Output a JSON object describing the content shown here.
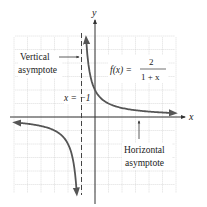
{
  "chart_data": {
    "type": "line",
    "title": "",
    "function_label": "f(x) = 2 / (1 + x)",
    "function_parts": {
      "lhs": "f(x) =",
      "numerator": "2",
      "denominator": "1 + x"
    },
    "xlabel": "x",
    "ylabel": "y",
    "xlim": [
      -6,
      6
    ],
    "ylim": [
      -6,
      6
    ],
    "grid": true,
    "series": [
      {
        "name": "f(x) = 2/(1+x), right branch",
        "x": [
          -0.82,
          -0.75,
          -0.5,
          -0.25,
          0,
          0.5,
          1,
          2,
          3,
          4,
          5,
          5.8
        ],
        "y": [
          11.1,
          8,
          4,
          2.67,
          2,
          1.33,
          1,
          0.67,
          0.5,
          0.4,
          0.33,
          0.29
        ]
      },
      {
        "name": "f(x) = 2/(1+x), left branch",
        "x": [
          -5.8,
          -5,
          -4,
          -3,
          -2.5,
          -2,
          -1.75,
          -1.5,
          -1.35,
          -1.25
        ],
        "y": [
          -0.42,
          -0.5,
          -0.67,
          -1,
          -1.33,
          -2,
          -2.67,
          -4,
          -5.7,
          -8
        ]
      }
    ],
    "asymptotes": {
      "vertical": {
        "x": -1,
        "label": "x = −1"
      },
      "horizontal": {
        "y": 0
      }
    },
    "annotations": [
      {
        "text_lines": [
          "Vertical",
          "asymptote"
        ],
        "points_to": "vertical asymptote"
      },
      {
        "text_lines": [
          "Horizontal",
          "asymptote"
        ],
        "points_to": "horizontal asymptote (x-axis)"
      },
      {
        "text": "x = −1",
        "near": "vertical asymptote"
      }
    ]
  },
  "labels": {
    "axis_x": "x",
    "axis_y": "y",
    "func_lhs": "f(x) =",
    "func_num": "2",
    "func_den": "1 + x",
    "vert_line1": "Vertical",
    "vert_line2": "asymptote",
    "horiz_line1": "Horizontal",
    "horiz_line2": "asymptote",
    "asym_eq": "x = −1"
  },
  "colors": {
    "curve": "#555555",
    "axis": "#333333",
    "grid": "#c8c8c8",
    "dashed": "#444444",
    "text": "#222222"
  }
}
